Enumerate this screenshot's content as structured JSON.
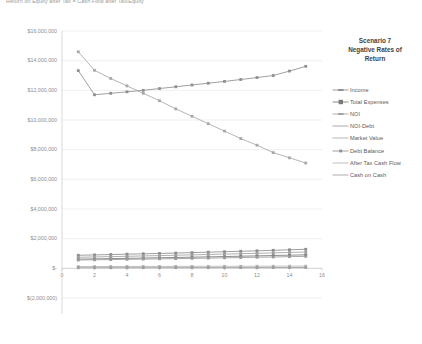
{
  "chart_title": "Return on Equity after Tax = Cash Flow after Tax/Equity",
  "legend": {
    "title_line1": "Scenario 7",
    "title_line2": "Negative Rates of",
    "title_line3": "Return",
    "entries": [
      {
        "label": "Income",
        "color": "#8C8C8C",
        "marker": "dash-h"
      },
      {
        "label": "Total Expenses",
        "color": "#7A7A7A",
        "marker": "square"
      },
      {
        "label": "NOI",
        "color": "#A0A0A0",
        "marker": "dash-h"
      },
      {
        "label": "NOI-Debt",
        "color": "#9A9A9A",
        "marker": "line"
      },
      {
        "label": "Market Value",
        "color": "#A8A8A8",
        "marker": "line"
      },
      {
        "label": "Debt Balance",
        "color": "#8F8F8F",
        "marker": "dot"
      },
      {
        "label": "After Tax Cash Flow",
        "color": "#B5B5B5",
        "marker": "line"
      },
      {
        "label": "Cash on Cash",
        "color": "#9E9E9E",
        "marker": "line"
      }
    ]
  },
  "axes": {
    "y_ticks": [
      "$16,000,000",
      "$14,000,000",
      "$12,000,000",
      "$10,000,000",
      "$8,000,000",
      "$6,000,000",
      "$4,000,000",
      "$2,000,000",
      "$-",
      "$(2,000,000)"
    ],
    "y_values": [
      16000000,
      14000000,
      12000000,
      10000000,
      8000000,
      6000000,
      4000000,
      2000000,
      0,
      -2000000
    ],
    "x_ticks": [
      "0",
      "2",
      "4",
      "6",
      "8",
      "10",
      "12",
      "14",
      "16"
    ],
    "x_values": [
      0,
      2,
      4,
      6,
      8,
      10,
      12,
      14,
      16
    ]
  },
  "chart_data": {
    "type": "line",
    "title": "Return on Equity after Tax = Cash Flow after Tax/Equity",
    "xlabel": "",
    "ylabel": "",
    "xlim": [
      0,
      16
    ],
    "ylim": [
      -2000000,
      16000000
    ],
    "grid": true,
    "legend_position": "right",
    "x": [
      1,
      2,
      3,
      4,
      5,
      6,
      7,
      8,
      9,
      10,
      11,
      12,
      13,
      14,
      15
    ],
    "series": [
      {
        "name": "Market Value",
        "color": "#A8A8A8",
        "values": [
          14600000,
          13350000,
          12800000,
          12300000,
          11800000,
          11300000,
          10750000,
          10250000,
          9750000,
          9250000,
          8750000,
          8300000,
          7800000,
          7450000,
          7100000
        ]
      },
      {
        "name": "Debt Balance",
        "color": "#8F8F8F",
        "values": [
          13330000,
          11700000,
          11800000,
          11900000,
          12000000,
          12120000,
          12240000,
          12360000,
          12480000,
          12600000,
          12730000,
          12860000,
          13000000,
          13300000,
          13620000
        ]
      },
      {
        "name": "Income",
        "color": "#8C8C8C",
        "values": [
          880000,
          905000,
          930000,
          955000,
          980000,
          1005000,
          1030000,
          1060000,
          1090000,
          1120000,
          1150000,
          1180000,
          1215000,
          1250000,
          1285000
        ]
      },
      {
        "name": "Total Expenses",
        "color": "#7A7A7A",
        "values": [
          620000,
          638000,
          656000,
          674000,
          692000,
          712000,
          732000,
          752000,
          773000,
          795000,
          817000,
          840000,
          863000,
          887000,
          912000
        ]
      },
      {
        "name": "NOI",
        "color": "#A0A0A0",
        "values": [
          745000,
          768000,
          790000,
          812000,
          836000,
          860000,
          884000,
          908000,
          934000,
          960000,
          986000,
          1013000,
          1041000,
          1070000,
          1099000
        ]
      },
      {
        "name": "NOI-Debt",
        "color": "#9A9A9A",
        "values": [
          560000,
          575000,
          590000,
          606000,
          622000,
          638000,
          655000,
          672000,
          690000,
          708000,
          727000,
          746000,
          766000,
          786000,
          807000
        ]
      },
      {
        "name": "After Tax Cash Flow",
        "color": "#B5B5B5",
        "values": [
          120000,
          122000,
          124000,
          126000,
          128000,
          130000,
          132000,
          134000,
          136000,
          138000,
          140000,
          142000,
          144000,
          146000,
          148000
        ]
      },
      {
        "name": "Cash on Cash",
        "color": "#9E9E9E",
        "values": [
          40000,
          41000,
          42000,
          43000,
          44000,
          45000,
          46000,
          47000,
          48000,
          49000,
          50000,
          51000,
          52000,
          53000,
          54000
        ]
      }
    ]
  }
}
